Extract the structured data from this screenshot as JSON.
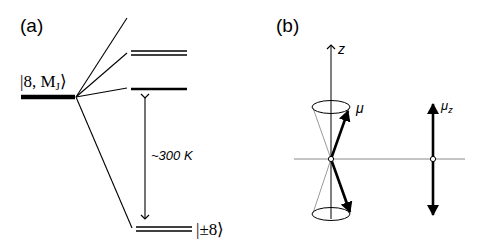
{
  "panel_a": {
    "label": "(a)",
    "initial_state_label": "|8, M",
    "initial_state_sub": "J",
    "ground_state_label": "|±8⟩",
    "energy_gap_label": "~300 K"
  },
  "panel_b": {
    "label": "(b)",
    "axis_label": "z",
    "moment_label": "μ",
    "projection_label": "μ",
    "projection_sub": "z"
  }
}
